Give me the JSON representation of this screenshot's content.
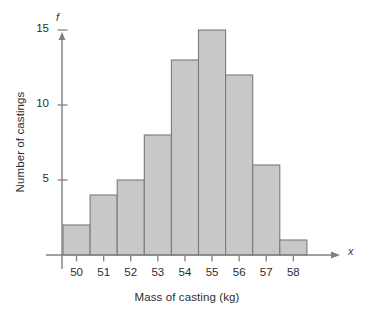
{
  "chart_data": {
    "type": "bar",
    "title": "",
    "subtitle": "",
    "xlabel": "Mass of casting (kg)",
    "ylabel": "Number of castings",
    "x_variable_symbol": "x",
    "y_variable_symbol": "f",
    "categories": [
      "50",
      "51",
      "52",
      "53",
      "54",
      "55",
      "56",
      "57",
      "58"
    ],
    "values": [
      2,
      4,
      5,
      8,
      13,
      15,
      12,
      6,
      1
    ],
    "x": [
      50,
      51,
      52,
      53,
      54,
      55,
      56,
      57,
      58
    ],
    "xlim": [
      49.5,
      58.5
    ],
    "ylim": [
      0,
      15.8
    ],
    "yticks": [
      5,
      10,
      15
    ],
    "ytick_labels": [
      "5",
      "10",
      "15"
    ],
    "xticks": [
      50,
      51,
      52,
      53,
      54,
      55,
      56,
      57,
      58
    ],
    "xtick_labels": [
      "50",
      "51",
      "52",
      "53",
      "54",
      "55",
      "56",
      "57",
      "58"
    ],
    "grid": false,
    "legend": null,
    "legend_position": "none",
    "bar_fill_color": "#c8c8c8",
    "bar_edge_color": "#7a7a7a",
    "axis_color": "#808080",
    "text_color": "#2e2e2e",
    "background_color": "#ffffff",
    "annotations": []
  }
}
